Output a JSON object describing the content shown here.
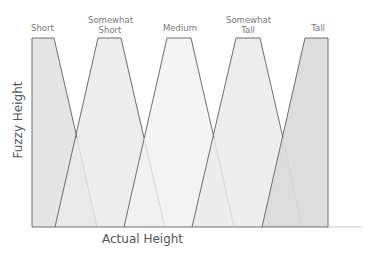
{
  "diagram": {
    "title": "",
    "x_axis_label": "Actual Height",
    "y_axis_label": "Fuzzy Height",
    "sets": [
      {
        "name": "Short",
        "line1": "Short",
        "line2": "",
        "fill": "#e2e2e2"
      },
      {
        "name": "Somewhat Short",
        "line1": "Somewhat",
        "line2": "Short",
        "fill": "#e9e9e9"
      },
      {
        "name": "Medium",
        "line1": "Medium",
        "line2": "",
        "fill": "#f3f3f3"
      },
      {
        "name": "Somewhat Tall",
        "line1": "Somewhat",
        "line2": "Tall",
        "fill": "#ebebeb"
      },
      {
        "name": "Tall",
        "line1": "Tall",
        "line2": "",
        "fill": "#d6d6d6"
      }
    ],
    "line_color": "#6e6e6e"
  }
}
